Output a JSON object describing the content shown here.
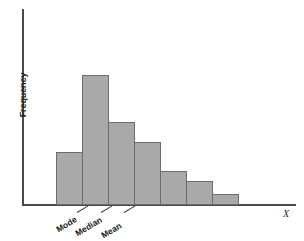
{
  "chart_data": {
    "type": "bar",
    "title": "",
    "subtitle": "",
    "xlabel": "X",
    "ylabel": "Frequency",
    "categories": [
      "1",
      "2",
      "3",
      "4",
      "5",
      "6",
      "7"
    ],
    "values": [
      42,
      103,
      66,
      50,
      27,
      19,
      9
    ],
    "ylim": [
      0,
      115
    ],
    "grid": false,
    "legend": null,
    "bar_color": "#a9a9a9",
    "bar_border_color": "#6c6c6c",
    "axis_color": "#4a4a4a",
    "annotations": [
      {
        "label": "Mode",
        "bar_index": 1,
        "x_value": 95
      },
      {
        "label": "Median",
        "bar_index": 2,
        "x_value": 118
      },
      {
        "label": "Mean",
        "bar_index": 3,
        "x_value": 139
      }
    ]
  },
  "axis": {
    "y_title": "Frequency",
    "x_title": "X"
  },
  "annotations": {
    "mode": "Mode",
    "median": "Median",
    "mean": "Mean"
  }
}
